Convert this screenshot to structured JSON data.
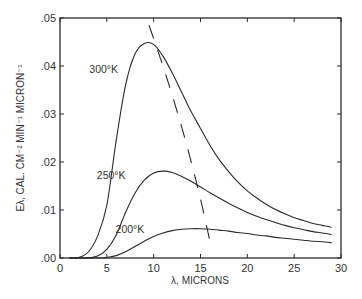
{
  "chart_data": {
    "type": "line",
    "title": "",
    "xlabel": "λ, MICRONS",
    "ylabel": "Eλ, CAL. CM⁻² MIN⁻¹ MICRON⁻¹",
    "xlim": [
      0,
      30
    ],
    "ylim": [
      0,
      0.05
    ],
    "grid": false,
    "legend": "inline curve labels",
    "x_ticks": [
      "0",
      "5",
      "10",
      "15",
      "20",
      "25",
      "30"
    ],
    "y_ticks": [
      ".00",
      ".01",
      ".02",
      ".03",
      ".04",
      ".05"
    ],
    "x": [
      1,
      2,
      3,
      4,
      5,
      6,
      7,
      8,
      9,
      10,
      11,
      12,
      13,
      14,
      15,
      16,
      17,
      18,
      19,
      20,
      21,
      22,
      23,
      24,
      25,
      26,
      27,
      28,
      29
    ],
    "series": [
      {
        "name": "300°K",
        "values": [
          0.0,
          0.0001,
          0.0012,
          0.0045,
          0.011,
          0.0245,
          0.036,
          0.0425,
          0.0447,
          0.0445,
          0.042,
          0.0385,
          0.0345,
          0.0305,
          0.027,
          0.0235,
          0.0205,
          0.018,
          0.0158,
          0.014,
          0.0125,
          0.0112,
          0.0101,
          0.0092,
          0.0084,
          0.0078,
          0.0072,
          0.0068,
          0.0064
        ]
      },
      {
        "name": "250°K",
        "values": [
          0.0,
          0.0,
          0.0,
          0.0004,
          0.0018,
          0.0048,
          0.0095,
          0.0135,
          0.0162,
          0.0177,
          0.0181,
          0.0178,
          0.017,
          0.016,
          0.0148,
          0.0136,
          0.0125,
          0.0114,
          0.0104,
          0.0095,
          0.0087,
          0.008,
          0.0074,
          0.0068,
          0.0063,
          0.0059,
          0.0055,
          0.0052,
          0.0049
        ]
      },
      {
        "name": "200°K",
        "values": [
          0.0,
          0.0,
          0.0,
          0.0,
          0.0001,
          0.0005,
          0.0013,
          0.0024,
          0.0035,
          0.0045,
          0.0052,
          0.0057,
          0.006,
          0.0061,
          0.0061,
          0.006,
          0.0058,
          0.0056,
          0.0053,
          0.0051,
          0.0048,
          0.0046,
          0.0043,
          0.0041,
          0.0039,
          0.0037,
          0.0035,
          0.0034,
          0.0032
        ]
      }
    ],
    "annotations": [
      {
        "text": "300°K",
        "x": 6.2,
        "y": 0.0385
      },
      {
        "text": "250°K",
        "x": 7.0,
        "y": 0.0165
      },
      {
        "text": "200°K",
        "x": 9.0,
        "y": 0.0053
      },
      {
        "text": "Wien displacement locus (dashed)",
        "points": [
          [
            9.5,
            0.0485
          ],
          [
            16,
            0.0035
          ]
        ]
      }
    ]
  }
}
